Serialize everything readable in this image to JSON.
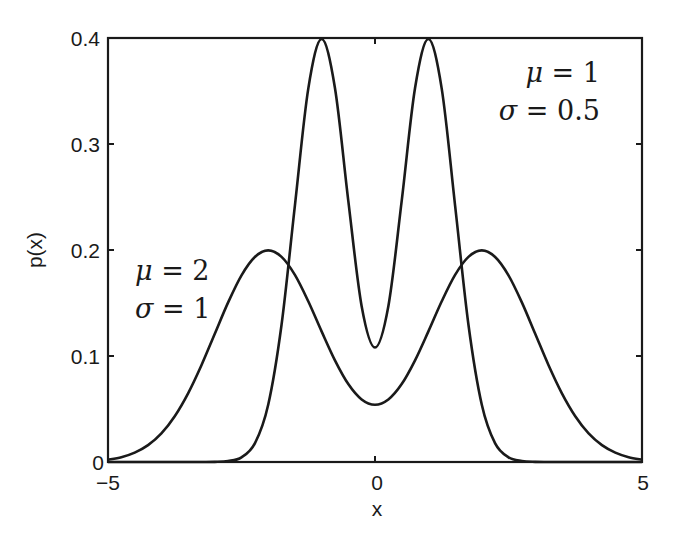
{
  "chart_data": {
    "type": "line",
    "title": "",
    "xlabel": "x",
    "ylabel": "p(x)",
    "xlim": [
      -5,
      5
    ],
    "ylim": [
      0,
      0.4
    ],
    "grid": false,
    "legend": null,
    "x_ticks": [
      -5,
      0,
      5
    ],
    "x_tick_labels": [
      "−5",
      "0",
      "5"
    ],
    "y_ticks": [
      0,
      0.1,
      0.2,
      0.3,
      0.4
    ],
    "y_tick_labels": [
      "0",
      "0.1",
      "0.2",
      "0.3",
      "0.4"
    ],
    "x": [
      -5,
      -4.75,
      -4.5,
      -4.25,
      -4,
      -3.75,
      -3.5,
      -3.25,
      -3,
      -2.75,
      -2.5,
      -2.25,
      -2,
      -1.75,
      -1.5,
      -1.25,
      -1,
      -0.75,
      -0.5,
      -0.25,
      0,
      0.25,
      0.5,
      0.75,
      1,
      1.25,
      1.5,
      1.75,
      2,
      2.25,
      2.5,
      2.75,
      3,
      3.25,
      3.5,
      3.75,
      4,
      4.25,
      4.5,
      4.75,
      5
    ],
    "series": [
      {
        "name": "mu=1, sigma=0.5",
        "description": "Mixture 0.5*N(-1,0.5^2)+0.5*N(1,0.5^2)",
        "values": [
          0,
          0,
          0,
          0,
          0,
          0,
          0,
          0,
          0.0001,
          0.0009,
          0.0044,
          0.0175,
          0.054,
          0.1295,
          0.2419,
          0.352,
          0.399,
          0.3529,
          0.2464,
          0.147,
          0.108,
          0.147,
          0.2464,
          0.3529,
          0.399,
          0.352,
          0.2419,
          0.1295,
          0.054,
          0.0175,
          0.0044,
          0.0009,
          0.0001,
          0,
          0,
          0,
          0,
          0,
          0,
          0,
          0
        ]
      },
      {
        "name": "mu=2, sigma=1",
        "description": "Mixture 0.5*N(-2,1)+0.5*N(2,1)",
        "values": [
          0.0022,
          0.0045,
          0.0088,
          0.0159,
          0.027,
          0.0432,
          0.0648,
          0.0913,
          0.121,
          0.1506,
          0.1761,
          0.1934,
          0.1996,
          0.1935,
          0.1765,
          0.1516,
          0.1232,
          0.0959,
          0.0735,
          0.059,
          0.054,
          0.059,
          0.0735,
          0.0959,
          0.1232,
          0.1516,
          0.1765,
          0.1935,
          0.1996,
          0.1934,
          0.1761,
          0.1506,
          0.121,
          0.0913,
          0.0648,
          0.0432,
          0.027,
          0.0159,
          0.0088,
          0.0045,
          0.0022
        ]
      }
    ],
    "annotations": [
      {
        "line1_sym": "μ",
        "line1_rest": " = 1",
        "line2_sym": "σ",
        "line2_rest": " = 0.5",
        "anchor": "top-right",
        "refers_to": "mu=1, sigma=0.5"
      },
      {
        "line1_sym": "μ",
        "line1_rest": " = 2",
        "line2_sym": "σ",
        "line2_rest": " = 1",
        "anchor": "left-middle",
        "refers_to": "mu=2, sigma=1"
      }
    ],
    "line_color": "#1a1a1a"
  }
}
